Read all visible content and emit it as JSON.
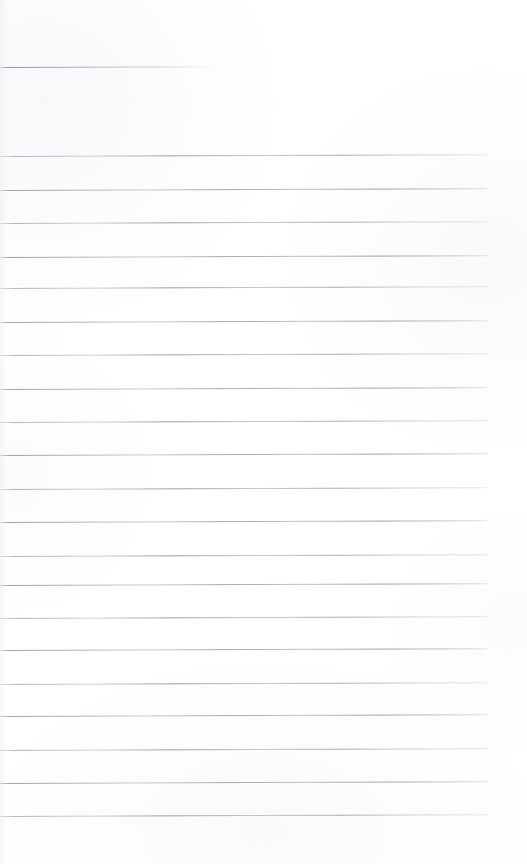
{
  "document": {
    "kind": "scanned-ruled-notebook-page",
    "title": "Blank Ruled Notebook Page",
    "page_width": 527,
    "page_height": 864,
    "background_color": "#ffffff",
    "rule_color": "#7e828b",
    "has_text": false,
    "has_handwriting": false,
    "body_text": "",
    "orientation": "portrait",
    "margin_left": 0,
    "margin_right": 40
  },
  "ruling": {
    "line_count": 21,
    "full_width_line_count": 20,
    "partial_line_count": 1,
    "line_spacing": 33.5,
    "line_thickness": 1,
    "tilt_degrees": -0.22,
    "lines": [
      {
        "id": "rule-partial-top",
        "y": 67,
        "x": 0,
        "width": 212,
        "type": "partial"
      },
      {
        "id": "rule-01",
        "y": 156,
        "x": 0,
        "width": 487,
        "type": "full"
      },
      {
        "id": "rule-02",
        "y": 190,
        "x": 0,
        "width": 487,
        "type": "full"
      },
      {
        "id": "rule-03",
        "y": 223,
        "x": 0,
        "width": 487,
        "type": "full"
      },
      {
        "id": "rule-04",
        "y": 257,
        "x": 0,
        "width": 487,
        "type": "full"
      },
      {
        "id": "rule-05",
        "y": 288,
        "x": 0,
        "width": 487,
        "type": "full"
      },
      {
        "id": "rule-06",
        "y": 322,
        "x": 0,
        "width": 487,
        "type": "full"
      },
      {
        "id": "rule-07",
        "y": 355,
        "x": 0,
        "width": 487,
        "type": "full"
      },
      {
        "id": "rule-08",
        "y": 389,
        "x": 0,
        "width": 487,
        "type": "full"
      },
      {
        "id": "rule-09",
        "y": 422,
        "x": 0,
        "width": 487,
        "type": "full"
      },
      {
        "id": "rule-10",
        "y": 455,
        "x": 0,
        "width": 487,
        "type": "full"
      },
      {
        "id": "rule-11",
        "y": 489,
        "x": 0,
        "width": 487,
        "type": "full"
      },
      {
        "id": "rule-12",
        "y": 522,
        "x": 0,
        "width": 487,
        "type": "full"
      },
      {
        "id": "rule-13",
        "y": 556,
        "x": 0,
        "width": 487,
        "type": "full"
      },
      {
        "id": "rule-14",
        "y": 585,
        "x": 0,
        "width": 487,
        "type": "full"
      },
      {
        "id": "rule-15",
        "y": 618,
        "x": 0,
        "width": 487,
        "type": "full"
      },
      {
        "id": "rule-16",
        "y": 650,
        "x": 0,
        "width": 487,
        "type": "full"
      },
      {
        "id": "rule-17",
        "y": 684,
        "x": 0,
        "width": 487,
        "type": "full"
      },
      {
        "id": "rule-18",
        "y": 716,
        "x": 0,
        "width": 487,
        "type": "full"
      },
      {
        "id": "rule-19",
        "y": 750,
        "x": 0,
        "width": 487,
        "type": "full"
      },
      {
        "id": "rule-20",
        "y": 783,
        "x": 0,
        "width": 487,
        "type": "full"
      },
      {
        "id": "rule-21",
        "y": 816,
        "x": 0,
        "width": 487,
        "type": "full"
      }
    ]
  }
}
